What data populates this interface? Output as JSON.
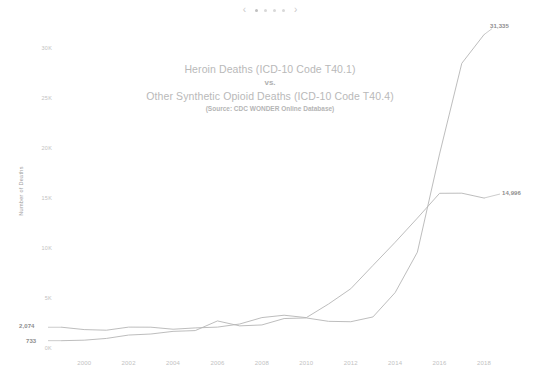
{
  "carousel": {
    "prev_label": "‹",
    "next_label": "›",
    "dots": 4,
    "active_index": 0
  },
  "chart_title": {
    "line1": "Heroin Deaths (ICD-10 Code T40.1)",
    "vs": "vs.",
    "line2": "Other Synthetic Opioid Deaths (ICD-10 Code T40.4)",
    "source": "(Source: CDC WONDER Online Database)"
  },
  "axis": {
    "ylabel": "Number of Deaths",
    "yticks": [
      "30K",
      "25K",
      "20K",
      "15K",
      "10K",
      "5K",
      "0K"
    ],
    "xticks": [
      "2000",
      "2002",
      "2004",
      "2006",
      "2008",
      "2010",
      "2012",
      "2014",
      "2016",
      "2018"
    ]
  },
  "endpoint_labels": {
    "heroin_start": "2,074",
    "synthetic_start": "733",
    "heroin_end": "14,996",
    "synthetic_end": "31,335"
  },
  "colors": {
    "line": "#b6b6b6",
    "text_muted": "#c2c2c2",
    "title": "#b9b9b9",
    "label": "#8d8d8d",
    "background": "#ffffff"
  },
  "chart_data": {
    "type": "line",
    "title": "Heroin Deaths (ICD-10 Code T40.1) vs. Other Synthetic Opioid Deaths (ICD-10 Code T40.4)",
    "subtitle": "(Source: CDC WONDER Online Database)",
    "xlabel": "",
    "ylabel": "Number of Deaths",
    "xlim": [
      1999,
      2018
    ],
    "ylim": [
      0,
      30000
    ],
    "ytick_values": [
      0,
      5000,
      10000,
      15000,
      20000,
      25000,
      30000
    ],
    "ytick_labels": [
      "0K",
      "5K",
      "10K",
      "15K",
      "20K",
      "25K",
      "30K"
    ],
    "xtick_values": [
      2000,
      2002,
      2004,
      2006,
      2008,
      2010,
      2012,
      2014,
      2016,
      2018
    ],
    "grid": false,
    "legend": "none",
    "x": [
      1999,
      2000,
      2001,
      2002,
      2003,
      2004,
      2005,
      2006,
      2007,
      2008,
      2009,
      2010,
      2011,
      2012,
      2013,
      2014,
      2015,
      2016,
      2017,
      2018
    ],
    "series": [
      {
        "name": "Heroin Deaths (ICD-10 Code T40.1)",
        "values": [
          2074,
          1842,
          1779,
          2089,
          2080,
          1878,
          2009,
          2088,
          2399,
          3041,
          3278,
          3036,
          4397,
          5925,
          8257,
          10574,
          12989,
          15469,
          15482,
          14996
        ],
        "start_label": "2,074",
        "end_label": "14,996"
      },
      {
        "name": "Other Synthetic Opioid Deaths (ICD-10 Code T40.4)",
        "values": [
          733,
          782,
          957,
          1295,
          1400,
          1664,
          1742,
          2707,
          2213,
          2306,
          2946,
          3007,
          2666,
          2628,
          3105,
          5544,
          9580,
          19413,
          28466,
          31335
        ],
        "start_label": "733",
        "end_label": "31,335"
      }
    ],
    "annotations": [
      {
        "text": "2,074",
        "x": 1999,
        "y": 2074
      },
      {
        "text": "733",
        "x": 1999,
        "y": 733
      },
      {
        "text": "14,996",
        "x": 2018,
        "y": 14996
      },
      {
        "text": "31,335",
        "x": 2018,
        "y": 31335
      }
    ]
  }
}
